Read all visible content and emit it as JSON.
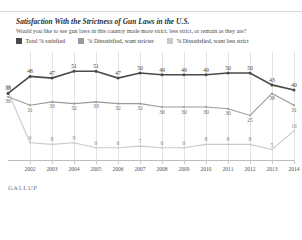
{
  "header": {
    "title": "Satisfaction With the Strictness of Gun Laws in the U.S.",
    "subtitle": "Would you like to see gun laws in this country made more strict, less strict, or remain as they are?"
  },
  "legend": [
    {
      "label": "Total % satisfied",
      "color": "#4a4a4a"
    },
    {
      "label": "% Dissatisfied, want stricter",
      "color": "#9a9a9a"
    },
    {
      "label": "% Dissatisfied, want less strict",
      "color": "#c9c9c9"
    }
  ],
  "source": "GALLUP",
  "chart_data": {
    "type": "line",
    "title": "Satisfaction With the Strictness of Gun Laws in the U.S.",
    "subtitle": "Would you like to see gun laws in this country made more strict, less strict, or remain as they are?",
    "xlabel": "",
    "ylabel": "",
    "ylim": [
      0,
      60
    ],
    "grid": true,
    "legend_position": "top",
    "categories": [
      "2001",
      "2002",
      "2003",
      "2004",
      "2005",
      "2006",
      "2007",
      "2008",
      "2009",
      "2010",
      "2011",
      "2012",
      "2013",
      "2014"
    ],
    "x_tick_labels": [
      "2002",
      "2003",
      "2004",
      "2005",
      "2006",
      "2007",
      "2008",
      "2009",
      "2010",
      "2011",
      "2012",
      "2013",
      "2014"
    ],
    "series": [
      {
        "name": "Total % satisfied",
        "color": "#4a4a4a",
        "values": [
          38,
          48,
          47,
          51,
          51,
          47,
          50,
          49,
          49,
          49,
          50,
          50,
          43,
          40
        ]
      },
      {
        "name": "% Dissatisfied, want stricter",
        "color": "#9a9a9a",
        "values": [
          36,
          31,
          33,
          32,
          33,
          32,
          32,
          30,
          30,
          30,
          29,
          25,
          38,
          31
        ]
      },
      {
        "name": "% Dissatisfied, want less strict",
        "color": "#c9c9c9",
        "values": [
          39,
          9,
          8,
          9,
          6,
          6,
          7,
          6,
          6,
          8,
          8,
          8,
          5,
          16
        ]
      }
    ],
    "data_labels": {
      "satisfied": [
        "38",
        "48",
        "47",
        "51",
        "51",
        "47",
        "50",
        "49",
        "49",
        "49",
        "50",
        "50",
        "43",
        "40"
      ],
      "stricter": [
        "36",
        "31",
        "33",
        "32",
        "33",
        "32",
        "32",
        "30",
        "30",
        "30",
        "30",
        "25",
        "38",
        "31"
      ],
      "less_strict": [
        "39",
        "9",
        "8",
        "9",
        "6",
        "6",
        "7",
        "6",
        "6",
        "8",
        "8",
        "8",
        "5",
        "16"
      ]
    }
  }
}
